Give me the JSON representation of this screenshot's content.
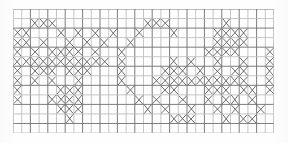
{
  "document": {
    "kind": "scanned-graph-paper-pattern",
    "title": "Cross-stitch grid pattern",
    "description": "Faxed/scanned sheet of graph paper with hand-drawn X marks filling selected cells.",
    "mark_glyph": "x-mark",
    "colors": {
      "background": "#fefefe",
      "grid_major": "#6e6e6e",
      "grid_minor": "#b9b9b9",
      "mark": "#555555"
    }
  },
  "grid": {
    "origin_x": 13,
    "origin_y": 9,
    "cell_width": 8.7,
    "cell_height": 9.54,
    "columns": 30,
    "rows": 13,
    "width": 261,
    "height": 124,
    "show_grid": true
  },
  "pattern": {
    "legend": "Each row lists the zero-based column indices of cells containing an X mark.",
    "rows": [
      {
        "row": 0,
        "cols": []
      },
      {
        "row": 1,
        "cols": [
          16,
          17,
          18,
          19,
          20,
          21,
          30,
          31,
          32,
          33,
          34,
          66
        ]
      },
      {
        "row": 2,
        "cols": [
          10,
          16,
          22,
          26,
          30,
          35,
          39,
          62,
          66,
          70
        ]
      },
      {
        "row": 3,
        "cols": []
      },
      {
        "row": 4,
        "cols": []
      },
      {
        "row": 5,
        "cols": []
      },
      {
        "row": 6,
        "cols": []
      },
      {
        "row": 7,
        "cols": []
      },
      {
        "row": 8,
        "cols": []
      },
      {
        "row": 9,
        "cols": []
      },
      {
        "row": 10,
        "cols": []
      },
      {
        "row": 11,
        "cols": []
      },
      {
        "row": 12,
        "cols": []
      }
    ],
    "cells": [
      [
        1,
        2
      ],
      [
        1,
        3
      ],
      [
        1,
        4
      ],
      [
        1,
        15
      ],
      [
        1,
        16
      ],
      [
        1,
        17
      ],
      [
        1,
        24
      ],
      [
        2,
        0
      ],
      [
        2,
        1
      ],
      [
        2,
        5
      ],
      [
        2,
        7
      ],
      [
        2,
        9
      ],
      [
        2,
        11
      ],
      [
        2,
        14
      ],
      [
        2,
        18
      ],
      [
        2,
        23
      ],
      [
        2,
        24
      ],
      [
        2,
        25
      ],
      [
        2,
        26
      ],
      [
        3,
        0
      ],
      [
        3,
        1
      ],
      [
        3,
        3
      ],
      [
        3,
        6
      ],
      [
        3,
        8
      ],
      [
        3,
        10
      ],
      [
        3,
        13
      ],
      [
        3,
        23
      ],
      [
        3,
        24
      ],
      [
        3,
        25
      ],
      [
        3,
        26
      ],
      [
        4,
        0
      ],
      [
        4,
        2
      ],
      [
        4,
        4
      ],
      [
        4,
        5
      ],
      [
        4,
        6
      ],
      [
        4,
        7
      ],
      [
        4,
        9
      ],
      [
        4,
        12
      ],
      [
        4,
        22
      ],
      [
        4,
        23
      ],
      [
        4,
        24
      ],
      [
        4,
        25
      ],
      [
        4,
        29
      ],
      [
        5,
        0
      ],
      [
        5,
        1
      ],
      [
        5,
        2
      ],
      [
        5,
        3
      ],
      [
        5,
        4
      ],
      [
        5,
        5
      ],
      [
        5,
        6
      ],
      [
        5,
        7
      ],
      [
        5,
        8
      ],
      [
        5,
        9
      ],
      [
        5,
        10
      ],
      [
        5,
        12
      ],
      [
        5,
        18
      ],
      [
        5,
        20
      ],
      [
        5,
        23
      ],
      [
        5,
        26
      ],
      [
        5,
        29
      ],
      [
        6,
        0
      ],
      [
        6,
        2
      ],
      [
        6,
        3
      ],
      [
        6,
        4
      ],
      [
        6,
        6
      ],
      [
        6,
        7
      ],
      [
        6,
        8
      ],
      [
        6,
        12
      ],
      [
        6,
        17
      ],
      [
        6,
        18
      ],
      [
        6,
        19
      ],
      [
        6,
        21
      ],
      [
        6,
        23
      ],
      [
        6,
        25
      ],
      [
        6,
        26
      ],
      [
        6,
        29
      ],
      [
        7,
        0
      ],
      [
        7,
        2
      ],
      [
        7,
        4
      ],
      [
        7,
        7
      ],
      [
        7,
        12
      ],
      [
        7,
        16
      ],
      [
        7,
        17
      ],
      [
        7,
        18
      ],
      [
        7,
        19
      ],
      [
        7,
        20
      ],
      [
        7,
        21
      ],
      [
        7,
        22
      ],
      [
        7,
        23
      ],
      [
        7,
        24
      ],
      [
        7,
        25
      ],
      [
        7,
        26
      ],
      [
        7,
        29
      ],
      [
        8,
        0
      ],
      [
        8,
        5
      ],
      [
        8,
        6
      ],
      [
        8,
        7
      ],
      [
        8,
        13
      ],
      [
        8,
        17
      ],
      [
        8,
        18
      ],
      [
        8,
        22
      ],
      [
        8,
        23
      ],
      [
        8,
        24
      ],
      [
        8,
        26
      ],
      [
        8,
        27
      ],
      [
        8,
        29
      ],
      [
        9,
        0
      ],
      [
        9,
        4
      ],
      [
        9,
        5
      ],
      [
        9,
        6
      ],
      [
        9,
        7
      ],
      [
        9,
        14
      ],
      [
        9,
        16
      ],
      [
        9,
        19
      ],
      [
        9,
        22
      ],
      [
        9,
        24
      ],
      [
        9,
        25
      ],
      [
        9,
        27
      ],
      [
        10,
        5
      ],
      [
        10,
        6
      ],
      [
        10,
        7
      ],
      [
        10,
        15
      ],
      [
        10,
        17
      ],
      [
        10,
        20
      ],
      [
        10,
        23
      ],
      [
        10,
        25
      ],
      [
        10,
        28
      ],
      [
        11,
        6
      ],
      [
        11,
        18
      ],
      [
        11,
        19
      ],
      [
        11,
        20
      ],
      [
        11,
        24
      ],
      [
        11,
        26
      ],
      [
        11,
        27
      ]
    ]
  }
}
